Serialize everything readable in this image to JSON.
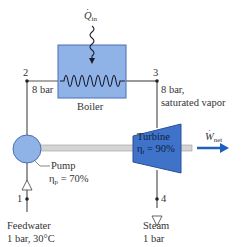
{
  "colors": {
    "component_fill": "#8fb3e6",
    "component_stroke": "#4a6fb3",
    "turbine_fill": "#3f73c9",
    "pipe": "#555555",
    "shaft": "#c8c8c8",
    "work_arrow": "#1f5fbf",
    "coil": "#1a1a2e"
  },
  "heat_input": {
    "symbol": "Q",
    "subscript": "in"
  },
  "boiler": {
    "label": "Boiler"
  },
  "turbine": {
    "label": "Turbine",
    "eff_symbol": "η",
    "eff_sub": "t",
    "eff_value": "= 90%"
  },
  "pump": {
    "label": "Pump",
    "eff_symbol": "η",
    "eff_sub": "p",
    "eff_value": "= 70%"
  },
  "work_output": {
    "symbol": "W",
    "subscript": "net"
  },
  "states": [
    {
      "id": "1",
      "desc_line1": "Feedwater",
      "desc_line2": "1 bar, 30°C"
    },
    {
      "id": "2",
      "desc_line1": "8 bar",
      "desc_line2": ""
    },
    {
      "id": "3",
      "desc_line1": "8 bar,",
      "desc_line2": "saturated vapor"
    },
    {
      "id": "4",
      "desc_line1": "Steam",
      "desc_line2": "1 bar"
    }
  ]
}
